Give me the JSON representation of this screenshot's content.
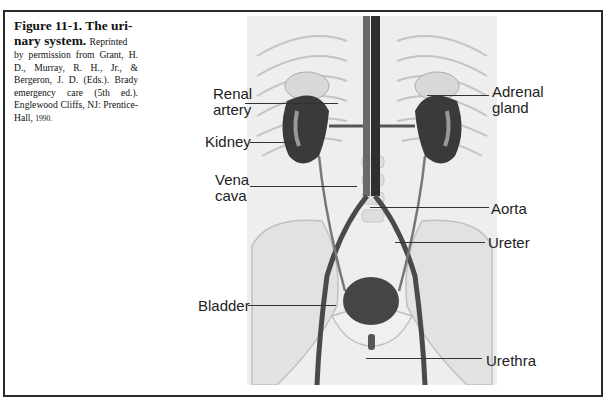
{
  "figure": {
    "number": "Figure 11-1.",
    "caption_credit": "Reprinted by permission from Grant, H. D., Murray, R. H., Jr., & Bergeron, J. D. (Eds.). Brady emergency care (5th ed.). Englewood Cliffs, NJ: Prentice-Hall, 1990.",
    "heading_line1": "Figure 11-1. The uri-",
    "heading_line2": "nary system.",
    "credit_line1": "Reprinted",
    "credit_rest": "by permission from Grant, H. D., Murray, R. H., Jr., & Bergeron, J. D. (Eds.). Brady emergency care (5th ed.). Englewood Cliffs, NJ: Prentice-Hall,",
    "credit_year": "1990."
  },
  "labels": {
    "renal_artery_1": "Renal",
    "renal_artery_2": "artery",
    "kidney": "Kidney",
    "vena_cava_1": "Vena",
    "vena_cava_2": "cava",
    "bladder": "Bladder",
    "adrenal_gland_1": "Adrenal",
    "adrenal_gland_2": "gland",
    "aorta": "Aorta",
    "ureter": "Ureter",
    "urethra": "Urethra"
  },
  "colors": {
    "organ_dark": "#3a3a3a",
    "illustration_bg": "#eeeeee",
    "frame": "#2a2a2a"
  }
}
